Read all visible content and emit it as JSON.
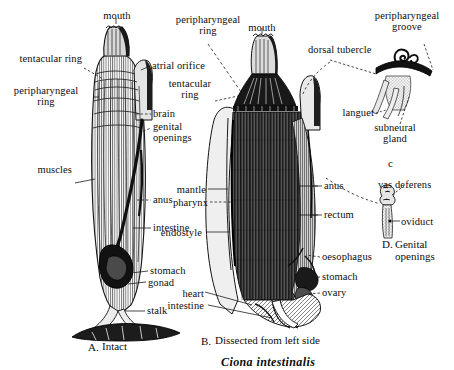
{
  "figure": {
    "species_caption": "Ciona intestinalis",
    "panels": [
      {
        "id": "A",
        "caption_prefix": "A.",
        "caption": "Intact"
      },
      {
        "id": "B",
        "caption_prefix": "B.",
        "caption": "Dissected from left side"
      },
      {
        "id": "C",
        "caption": "c"
      },
      {
        "id": "D",
        "caption_prefix": "D.",
        "caption": "Genital\nopenings"
      }
    ]
  },
  "labels": {
    "a_mouth": "mouth",
    "a_tentacular_ring": "tentacular ring",
    "a_peripharyngeal_ring": "peripharyngeal\nring",
    "a_atrial_orifice": "atrial orifice",
    "a_brain": "brain",
    "a_genital_openings": "genital\nopenings",
    "a_anus": "anus",
    "a_muscles": "muscles",
    "a_intestine": "intestine",
    "a_stomach": "stomach",
    "a_gonad": "gonad",
    "a_stalk": "stalk",
    "b_peripharyngeal_ring": "peripharyngeal\nring",
    "b_mouth": "mouth",
    "b_tentacular_ring": "tentacular\nring",
    "b_mantle": "mantle",
    "b_pharynx": "pharynx",
    "b_endostyle": "endostyle",
    "b_heart": "heart",
    "b_intestine": "intestine",
    "b_anus": "anus",
    "b_rectum": "rectum",
    "b_oesophagus": "oesophagus",
    "b_stomach": "stomach",
    "b_ovary": "ovary",
    "c_dorsal_tubercle": "dorsal tubercle",
    "c_peripharyngeal_groove": "peripharyngeal\ngroove",
    "c_languet": "languet",
    "c_subneural_gland": "subneural\ngland",
    "d_vas_deferens": "vas deferens",
    "d_oviduct": "oviduct"
  },
  "colors": {
    "ink": "#111111",
    "paper": "#ffffff",
    "leader": "#2a2a2a"
  }
}
